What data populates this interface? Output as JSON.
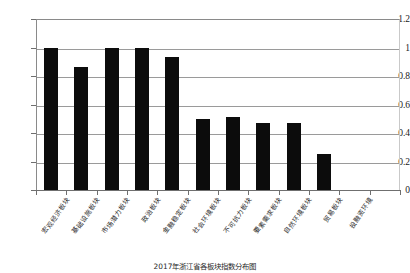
{
  "chart_data": {
    "type": "bar",
    "title": "",
    "caption": "2017年浙江省各板块指数分布图",
    "xlabel": "",
    "ylabel": "",
    "ylim": [
      0,
      1.2
    ],
    "ytick_values": [
      0,
      0.2,
      0.4,
      0.6,
      0.8,
      1,
      1.2
    ],
    "ytick_labels": [
      "0",
      "0.2",
      "0.4",
      "0.6",
      "0.8",
      "1",
      "1.2"
    ],
    "grid": "horizontal",
    "legend": "none",
    "bar_color": "#0c0c0c",
    "categories": [
      "宏观经济板块",
      "基础设施板块",
      "市场潜力板块",
      "政治板块",
      "金融稳定板块",
      "社会环境板块",
      "不可抗力板块",
      "要素需求板块",
      "自然环境板块",
      "贸易板块",
      "投融资环境"
    ],
    "values": [
      1.0,
      0.86,
      1.0,
      1.0,
      0.93,
      0.5,
      0.51,
      0.47,
      0.47,
      0.25,
      0.0
    ]
  }
}
